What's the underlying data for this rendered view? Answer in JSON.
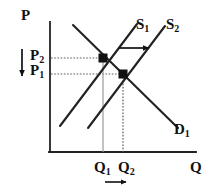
{
  "figure": {
    "kind": "supply-demand-diagram",
    "background_color": "#ffffff",
    "ink_color": "#111111",
    "guide_color": "#8a8a8a"
  },
  "axes": {
    "y_axis_label": "P",
    "x_axis_label": "Q",
    "origin_px": {
      "x": 50,
      "y": 152
    },
    "y_top_px": 22,
    "x_right_px": 196
  },
  "price_labels": [
    {
      "id": "P2",
      "text": "P",
      "sub": "2",
      "y_px": 58
    },
    {
      "id": "P1",
      "text": "P",
      "sub": "1",
      "y_px": 74
    }
  ],
  "quantity_labels": [
    {
      "id": "Q1",
      "text": "Q",
      "sub": "1",
      "x_px": 103
    },
    {
      "id": "Q2",
      "text": "Q",
      "sub": "2",
      "x_px": 123
    }
  ],
  "curves": [
    {
      "id": "D1",
      "label_text": "D",
      "label_sub": "1",
      "role": "demand",
      "from_px": {
        "x": 73,
        "y": 25
      },
      "to_px": {
        "x": 178,
        "y": 128
      }
    },
    {
      "id": "S1",
      "label_text": "S",
      "label_sub": "1",
      "role": "supply-original",
      "from_px": {
        "x": 60,
        "y": 126
      },
      "to_px": {
        "x": 137,
        "y": 24
      }
    },
    {
      "id": "S2",
      "label_text": "S",
      "label_sub": "2",
      "role": "supply-shifted",
      "from_px": {
        "x": 88,
        "y": 128
      },
      "to_px": {
        "x": 165,
        "y": 26
      }
    }
  ],
  "equilibria": [
    {
      "id": "E1",
      "price_label": "P2",
      "quantity_label": "Q1",
      "x_px": 103,
      "y_px": 58
    },
    {
      "id": "E2",
      "price_label": "P1",
      "quantity_label": "Q2",
      "x_px": 123,
      "y_px": 74
    }
  ],
  "arrows": [
    {
      "id": "supply-shift-arrow",
      "direction": "right",
      "from_px": {
        "x": 119,
        "y": 48
      },
      "to_px": {
        "x": 150,
        "y": 48
      }
    },
    {
      "id": "price-decrease-arrow",
      "direction": "down",
      "from_px": {
        "x": 22,
        "y": 50
      },
      "to_px": {
        "x": 22,
        "y": 77
      }
    },
    {
      "id": "quantity-increase-arrow",
      "direction": "right",
      "from_px": {
        "x": 105,
        "y": 182
      },
      "to_px": {
        "x": 127,
        "y": 182
      }
    }
  ]
}
